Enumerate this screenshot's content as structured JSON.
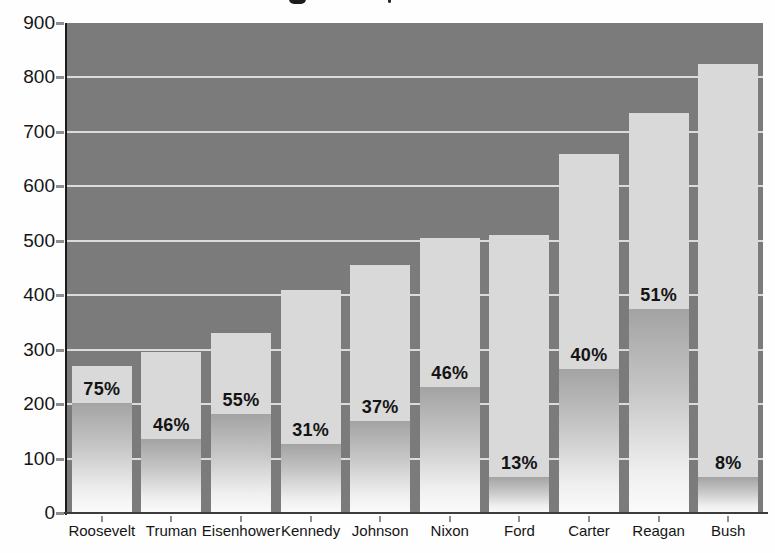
{
  "page": {
    "kind": "scanned textbook bar chart",
    "title_visible_text": "",
    "title_note": "title cropped off at top edge; only two letter-descender marks visible"
  },
  "chart_data": {
    "type": "bar",
    "title": "",
    "xlabel": "",
    "ylabel": "",
    "categories": [
      "Roosevelt",
      "Truman",
      "Eisenhower",
      "Kennedy",
      "Johnson",
      "Nixon",
      "Ford",
      "Carter",
      "Reagan",
      "Bush"
    ],
    "series": [
      {
        "name": "bar-total-height",
        "values": [
          270,
          295,
          330,
          410,
          455,
          505,
          510,
          660,
          735,
          825
        ]
      },
      {
        "name": "lower-shaded-share-of-bar-pct",
        "values": [
          75,
          46,
          55,
          31,
          37,
          46,
          13,
          40,
          51,
          8
        ]
      }
    ],
    "bar_percent_labels": [
      "75%",
      "46%",
      "55%",
      "31%",
      "37%",
      "46%",
      "13%",
      "40%",
      "51%",
      "8%"
    ],
    "ylim": [
      0,
      900
    ],
    "yticks": [
      0,
      100,
      200,
      300,
      400,
      500,
      600,
      700,
      800,
      900
    ],
    "grid": "horizontal white gridlines on dark plot background, bars drawn over gridlines",
    "legend_position": "none",
    "colors": {
      "plot_background": "#7b7b7b",
      "bar_upper": "#d9d9d9",
      "bar_lower_gradient_top": "#a3a3a3",
      "bar_lower_gradient_bottom": "#fbfbfb",
      "gridline": "#e4e4e4",
      "axis_line": "#1b1b1b",
      "tick": "#8f8f8f",
      "text": "#151515"
    }
  }
}
